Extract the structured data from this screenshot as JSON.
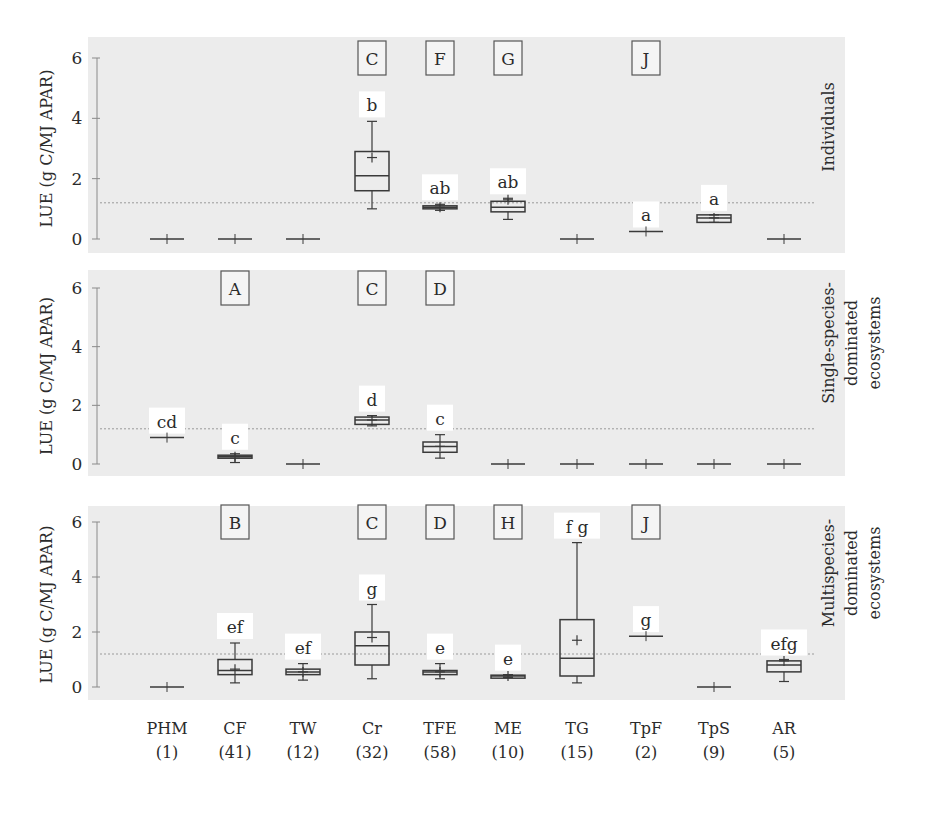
{
  "chart_data": {
    "type": "box",
    "title": "",
    "ylabel": "LUE (g C/MJ APAR)",
    "ylim": [
      0,
      6
    ],
    "yticks": [
      0,
      2,
      4,
      6
    ],
    "grid": false,
    "reference_line": 1.2,
    "categories": [
      "PHM",
      "CF",
      "TW",
      "Cr",
      "TFE",
      "ME",
      "TG",
      "TpF",
      "TpS",
      "AR"
    ],
    "category_n": [
      "(1)",
      "(41)",
      "(12)",
      "(32)",
      "(58)",
      "(10)",
      "(15)",
      "(2)",
      "(9)",
      "(5)"
    ],
    "panels": [
      {
        "name": "Individuals",
        "label_lines": [
          "Individuals"
        ],
        "group_letters": {
          "Cr": "C",
          "TFE": "F",
          "ME": "G",
          "TpF": "J"
        },
        "boxes": [
          {
            "cat": "PHM",
            "min": 0,
            "q1": 0,
            "median": 0,
            "q3": 0,
            "max": 0,
            "mean": 0,
            "sig": ""
          },
          {
            "cat": "CF",
            "min": 0,
            "q1": 0,
            "median": 0,
            "q3": 0,
            "max": 0,
            "mean": 0,
            "sig": ""
          },
          {
            "cat": "TW",
            "min": 0,
            "q1": 0,
            "median": 0,
            "q3": 0,
            "max": 0,
            "mean": 0,
            "sig": ""
          },
          {
            "cat": "Cr",
            "min": 1.0,
            "q1": 1.6,
            "median": 2.1,
            "q3": 2.9,
            "max": 3.9,
            "mean": 2.7,
            "sig": "b"
          },
          {
            "cat": "TFE",
            "min": 0.95,
            "q1": 1.0,
            "median": 1.05,
            "q3": 1.1,
            "max": 1.15,
            "mean": 1.05,
            "sig": "ab"
          },
          {
            "cat": "ME",
            "min": 0.65,
            "q1": 0.9,
            "median": 1.05,
            "q3": 1.25,
            "max": 1.35,
            "mean": 1.3,
            "sig": "ab"
          },
          {
            "cat": "TG",
            "min": 0,
            "q1": 0,
            "median": 0,
            "q3": 0,
            "max": 0,
            "mean": 0,
            "sig": ""
          },
          {
            "cat": "TpF",
            "min": 0.25,
            "q1": 0.25,
            "median": 0.25,
            "q3": 0.25,
            "max": 0.25,
            "mean": 0.25,
            "sig": "a"
          },
          {
            "cat": "TpS",
            "min": 0.55,
            "q1": 0.55,
            "median": 0.7,
            "q3": 0.8,
            "max": 0.8,
            "mean": 0.7,
            "sig": "a"
          },
          {
            "cat": "AR",
            "min": 0,
            "q1": 0,
            "median": 0,
            "q3": 0,
            "max": 0,
            "mean": 0,
            "sig": ""
          }
        ]
      },
      {
        "name": "Single-species-dominated ecosystems",
        "label_lines": [
          "Single-species-",
          "dominated",
          "ecosystems"
        ],
        "group_letters": {
          "CF": "A",
          "Cr": "C",
          "TFE": "D"
        },
        "boxes": [
          {
            "cat": "PHM",
            "min": 0.9,
            "q1": 0.9,
            "median": 0.9,
            "q3": 0.9,
            "max": 0.9,
            "mean": 0.9,
            "sig": "cd"
          },
          {
            "cat": "CF",
            "min": 0.05,
            "q1": 0.2,
            "median": 0.25,
            "q3": 0.3,
            "max": 0.35,
            "mean": 0.25,
            "sig": "c"
          },
          {
            "cat": "TW",
            "min": 0,
            "q1": 0,
            "median": 0,
            "q3": 0,
            "max": 0,
            "mean": 0,
            "sig": ""
          },
          {
            "cat": "Cr",
            "min": 1.3,
            "q1": 1.35,
            "median": 1.5,
            "q3": 1.6,
            "max": 1.65,
            "mean": 1.5,
            "sig": "d"
          },
          {
            "cat": "TFE",
            "min": 0.2,
            "q1": 0.4,
            "median": 0.6,
            "q3": 0.75,
            "max": 1.0,
            "mean": 0.6,
            "sig": "c"
          },
          {
            "cat": "ME",
            "min": 0,
            "q1": 0,
            "median": 0,
            "q3": 0,
            "max": 0,
            "mean": 0,
            "sig": ""
          },
          {
            "cat": "TG",
            "min": 0,
            "q1": 0,
            "median": 0,
            "q3": 0,
            "max": 0,
            "mean": 0,
            "sig": ""
          },
          {
            "cat": "TpF",
            "min": 0,
            "q1": 0,
            "median": 0,
            "q3": 0,
            "max": 0,
            "mean": 0,
            "sig": ""
          },
          {
            "cat": "TpS",
            "min": 0,
            "q1": 0,
            "median": 0,
            "q3": 0,
            "max": 0,
            "mean": 0,
            "sig": ""
          },
          {
            "cat": "AR",
            "min": 0,
            "q1": 0,
            "median": 0,
            "q3": 0,
            "max": 0,
            "mean": 0,
            "sig": ""
          }
        ]
      },
      {
        "name": "Multispecies-dominated ecosystems",
        "label_lines": [
          "Multispecies-",
          "dominated",
          "ecosystems"
        ],
        "group_letters": {
          "CF": "B",
          "Cr": "C",
          "TFE": "D",
          "ME": "H",
          "TpF": "J"
        },
        "boxes": [
          {
            "cat": "PHM",
            "min": 0,
            "q1": 0,
            "median": 0,
            "q3": 0,
            "max": 0,
            "mean": 0,
            "sig": ""
          },
          {
            "cat": "CF",
            "min": 0.15,
            "q1": 0.45,
            "median": 0.6,
            "q3": 1.0,
            "max": 1.6,
            "mean": 0.65,
            "sig": "ef"
          },
          {
            "cat": "TW",
            "min": 0.25,
            "q1": 0.45,
            "median": 0.55,
            "q3": 0.65,
            "max": 0.85,
            "mean": 0.55,
            "sig": "ef"
          },
          {
            "cat": "Cr",
            "min": 0.3,
            "q1": 0.8,
            "median": 1.5,
            "q3": 2.0,
            "max": 3.0,
            "mean": 1.8,
            "sig": "g"
          },
          {
            "cat": "TFE",
            "min": 0.3,
            "q1": 0.45,
            "median": 0.55,
            "q3": 0.6,
            "max": 0.85,
            "mean": 0.55,
            "sig": "e"
          },
          {
            "cat": "ME",
            "min": 0.35,
            "q1": 0.38,
            "median": 0.4,
            "q3": 0.43,
            "max": 0.45,
            "mean": 0.4,
            "sig": "e"
          },
          {
            "cat": "TG",
            "min": 0.15,
            "q1": 0.4,
            "median": 1.05,
            "q3": 2.45,
            "max": 5.25,
            "mean": 1.7,
            "sig": "f g"
          },
          {
            "cat": "TpF",
            "min": 1.85,
            "q1": 1.85,
            "median": 1.85,
            "q3": 1.85,
            "max": 1.85,
            "mean": 1.85,
            "sig": "g"
          },
          {
            "cat": "TpS",
            "min": 0,
            "q1": 0,
            "median": 0,
            "q3": 0,
            "max": 0,
            "mean": 0,
            "sig": ""
          },
          {
            "cat": "AR",
            "min": 0.2,
            "q1": 0.55,
            "median": 0.8,
            "q3": 0.95,
            "max": 1.0,
            "mean": 0.95,
            "sig": "efg"
          }
        ]
      }
    ]
  },
  "layout": {
    "plot_left": 88,
    "plot_right": 815,
    "axis_x": 97,
    "panels_geom": [
      {
        "top": 37,
        "bottom": 253,
        "y0": 239,
        "y6": 58
      },
      {
        "top": 270,
        "bottom": 476,
        "y0": 464,
        "y6": 288
      },
      {
        "top": 506,
        "bottom": 700,
        "y0": 687,
        "y6": 522
      }
    ],
    "cat_x": [
      167,
      235,
      303,
      372,
      440,
      508,
      577,
      646,
      714,
      784
    ],
    "colors": {
      "panel_bg": "#ececec",
      "line": "#3a3a3a",
      "ref_line": "#9a9a9a",
      "label_bg": "#ffffff"
    }
  }
}
